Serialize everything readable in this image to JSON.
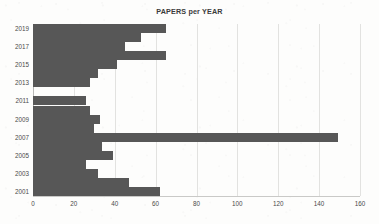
{
  "chart_data": {
    "type": "bar",
    "orientation": "horizontal",
    "title": "PAPERS per YEAR",
    "xlabel": "",
    "ylabel": "",
    "xlim": [
      0,
      160
    ],
    "ylim": [
      2000,
      2020
    ],
    "xticks": [
      0,
      20,
      40,
      60,
      80,
      100,
      120,
      140,
      160
    ],
    "ytick_labels": [
      "2019",
      "2017",
      "2015",
      "2013",
      "2011",
      "2009",
      "2007",
      "2005",
      "2003",
      "2001"
    ],
    "grid": "vertical",
    "legend": "none",
    "bar_color": "#575757",
    "categories": [
      "2019",
      "2018",
      "2017",
      "2016",
      "2015",
      "2014",
      "2013",
      "2012",
      "2011",
      "2010",
      "2009",
      "2008",
      "2007",
      "2006",
      "2005",
      "2004",
      "2003",
      "2002",
      "2001"
    ],
    "values": [
      65,
      53,
      45,
      65,
      41,
      32,
      28,
      0,
      26,
      28,
      33,
      30,
      149,
      34,
      39,
      26,
      32,
      47,
      62
    ]
  },
  "axis": {
    "x_tick_labels": [
      "0",
      "20",
      "40",
      "60",
      "80",
      "100",
      "120",
      "140",
      "160"
    ],
    "y_tick_labels": [
      "2019",
      "2017",
      "2015",
      "2013",
      "2011",
      "2009",
      "2007",
      "2005",
      "2003",
      "2001"
    ]
  }
}
